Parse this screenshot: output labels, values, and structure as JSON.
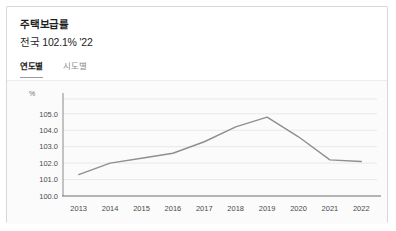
{
  "card": {
    "title": "주택보급률",
    "subtitle": "전국 102.1% '22"
  },
  "tabs": [
    {
      "label": "연도별",
      "active": true,
      "name": "tab-by-year"
    },
    {
      "label": "시도별",
      "active": false,
      "name": "tab-by-region"
    }
  ],
  "chart_data": {
    "type": "line",
    "title": "주택보급률",
    "subtitle": "전국 102.1% '22",
    "xlabel": "",
    "ylabel": "",
    "unit": "%",
    "categories": [
      "2013",
      "2014",
      "2015",
      "2016",
      "2017",
      "2018",
      "2019",
      "2020",
      "2021",
      "2022"
    ],
    "values": [
      101.3,
      102.0,
      102.3,
      102.6,
      103.3,
      104.2,
      104.8,
      103.6,
      102.2,
      102.1
    ],
    "series": [
      {
        "name": "전국 주택보급률",
        "values": [
          101.3,
          102.0,
          102.3,
          102.6,
          103.3,
          104.2,
          104.8,
          103.6,
          102.2,
          102.1
        ]
      }
    ],
    "ylim": [
      100.0,
      105.9
    ],
    "ytick_values": [
      100.0,
      101.0,
      102.0,
      103.0,
      104.0,
      105.0
    ],
    "ytick_labels": [
      "100.0",
      "101.0",
      "102.0",
      "103.0",
      "104.0",
      "105.0"
    ],
    "grid": true,
    "legend": false,
    "line_color": "#8f8f8f",
    "grid_color": "#e3e3e3",
    "plot_background": "#fbfbfb"
  }
}
